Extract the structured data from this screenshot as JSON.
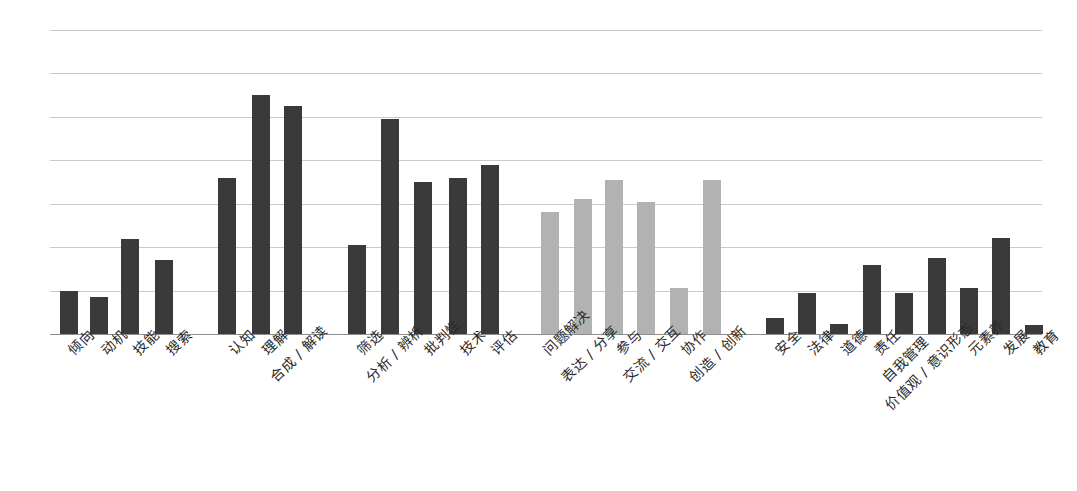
{
  "chart_data": {
    "type": "bar",
    "title": "",
    "subtitle": "",
    "xlabel": "",
    "ylabel": "",
    "ylim": [
      0,
      7
    ],
    "grid": true,
    "gridline_count": 8,
    "legend_position": "none",
    "orientation": "vertical",
    "label_rotation": -45,
    "colors": {
      "dark_bar": "#3a3a3a",
      "light_bar": "#b2b2b2",
      "gridline": "#c9c9c9",
      "axis": "#8d8d8d",
      "background": "#ffffff",
      "label_text": "#2a2a2a"
    },
    "groups": [
      {
        "name": "group-1",
        "color": "#3a3a3a",
        "categories": [
          "倾向",
          "动机",
          "技能",
          "搜索"
        ],
        "values": [
          1.0,
          0.86,
          2.18,
          1.7
        ]
      },
      {
        "name": "group-2",
        "color": "#3a3a3a",
        "categories": [
          "认知",
          "理解",
          "合成 / 解读",
          "筛选",
          "分析 / 辨析",
          "批判性",
          "技术",
          "评估"
        ],
        "values": [
          3.6,
          5.5,
          5.25,
          2.05,
          4.95,
          3.5,
          3.6,
          3.9
        ]
      },
      {
        "name": "group-3",
        "color": "#b2b2b2",
        "categories": [
          "问题解决",
          "表达 / 分享",
          "参与",
          "交流 / 交互",
          "协作",
          "创造 / 创新"
        ],
        "values": [
          2.8,
          3.12,
          3.55,
          3.05,
          1.05,
          3.55
        ]
      },
      {
        "name": "group-4",
        "color": "#3a3a3a",
        "categories": [
          "安全",
          "法律",
          "道德",
          "责任",
          "自我管理",
          "价值观 / 意识形态",
          "元素养",
          "发展",
          "教育"
        ],
        "values": [
          0.36,
          0.95,
          0.24,
          1.6,
          0.95,
          1.75,
          1.05,
          2.2,
          0.2
        ]
      }
    ],
    "categories_all": [
      "倾向",
      "动机",
      "技能",
      "搜索",
      "认知",
      "理解",
      "合成 / 解读",
      "筛选",
      "分析 / 辨析",
      "批判性",
      "技术",
      "评估",
      "问题解决",
      "表达 / 分享",
      "参与",
      "交流 / 交互",
      "协作",
      "创造 / 创新",
      "安全",
      "法律",
      "道德",
      "责任",
      "自我管理",
      "价值观 / 意识形态",
      "元素养",
      "发展",
      "教育"
    ],
    "values_all": [
      1.0,
      0.86,
      2.18,
      1.7,
      3.6,
      5.5,
      5.25,
      2.05,
      4.95,
      3.5,
      3.6,
      3.9,
      2.8,
      3.12,
      3.55,
      3.05,
      1.05,
      3.55,
      0.36,
      0.95,
      0.24,
      1.6,
      0.95,
      1.75,
      1.05,
      2.2,
      0.2
    ],
    "bars": [
      {
        "label": "倾向",
        "value": 1.0,
        "shade": "dark",
        "x": 60,
        "w": 18,
        "label_x": 63,
        "label_y": 345,
        "lines": 1
      },
      {
        "label": "动机",
        "value": 0.86,
        "shade": "dark",
        "x": 90,
        "w": 18,
        "label_x": 96,
        "label_y": 345,
        "lines": 1
      },
      {
        "label": "技能",
        "value": 2.18,
        "shade": "dark",
        "x": 121,
        "w": 18,
        "label_x": 128,
        "label_y": 345,
        "lines": 1
      },
      {
        "label": "搜索",
        "value": 1.7,
        "shade": "dark",
        "x": 155,
        "w": 18,
        "label_x": 161,
        "label_y": 345,
        "lines": 1
      },
      {
        "label": "认知",
        "value": 3.6,
        "shade": "dark",
        "x": 218,
        "w": 18,
        "label_x": 224,
        "label_y": 345,
        "lines": 1
      },
      {
        "label": "理解",
        "value": 5.5,
        "shade": "dark",
        "x": 252,
        "w": 18,
        "label_x": 257,
        "label_y": 345,
        "lines": 1
      },
      {
        "label": "合成 / 解读",
        "value": 5.25,
        "shade": "dark",
        "x": 284,
        "w": 18,
        "label_x": 265,
        "label_y": 372,
        "lines": 2
      },
      {
        "label": "筛选",
        "value": 2.05,
        "shade": "dark",
        "x": 348,
        "w": 18,
        "label_x": 352,
        "label_y": 345,
        "lines": 1
      },
      {
        "label": "分析 / 辨析",
        "value": 4.95,
        "shade": "dark",
        "x": 381,
        "w": 18,
        "label_x": 361,
        "label_y": 372,
        "lines": 2
      },
      {
        "label": "批判性",
        "value": 3.5,
        "shade": "dark",
        "x": 414,
        "w": 18,
        "label_x": 419,
        "label_y": 345,
        "lines": 1
      },
      {
        "label": "技术",
        "value": 3.6,
        "shade": "dark",
        "x": 449,
        "w": 18,
        "label_x": 455,
        "label_y": 345,
        "lines": 1
      },
      {
        "label": "评估",
        "value": 3.9,
        "shade": "dark",
        "x": 481,
        "w": 18,
        "label_x": 486,
        "label_y": 345,
        "lines": 1
      },
      {
        "label": "问题解决",
        "value": 2.8,
        "shade": "light",
        "x": 541,
        "w": 18,
        "label_x": 538,
        "label_y": 345,
        "lines": 1
      },
      {
        "label": "表达 / 分享",
        "value": 3.12,
        "shade": "light",
        "x": 574,
        "w": 18,
        "label_x": 556,
        "label_y": 372,
        "lines": 2
      },
      {
        "label": "参与",
        "value": 3.55,
        "shade": "light",
        "x": 605,
        "w": 18,
        "label_x": 611,
        "label_y": 345,
        "lines": 1
      },
      {
        "label": "交流 / 交互",
        "value": 3.05,
        "shade": "light",
        "x": 637,
        "w": 18,
        "label_x": 618,
        "label_y": 372,
        "lines": 2
      },
      {
        "label": "协作",
        "value": 1.05,
        "shade": "light",
        "x": 670,
        "w": 18,
        "label_x": 676,
        "label_y": 345,
        "lines": 1
      },
      {
        "label": "创造 / 创新",
        "value": 3.55,
        "shade": "light",
        "x": 703,
        "w": 18,
        "label_x": 684,
        "label_y": 372,
        "lines": 2
      },
      {
        "label": "安全",
        "value": 0.36,
        "shade": "dark",
        "x": 766,
        "w": 18,
        "label_x": 770,
        "label_y": 345,
        "lines": 1
      },
      {
        "label": "法律",
        "value": 0.95,
        "shade": "dark",
        "x": 798,
        "w": 18,
        "label_x": 803,
        "label_y": 345,
        "lines": 1
      },
      {
        "label": "道德",
        "value": 0.24,
        "shade": "dark",
        "x": 830,
        "w": 18,
        "label_x": 836,
        "label_y": 345,
        "lines": 1
      },
      {
        "label": "责任",
        "value": 1.6,
        "shade": "dark",
        "x": 863,
        "w": 18,
        "label_x": 869,
        "label_y": 345,
        "lines": 1
      },
      {
        "label": "自我管理",
        "value": 0.95,
        "shade": "dark",
        "x": 895,
        "w": 18,
        "label_x": 877,
        "label_y": 372,
        "lines": 2
      },
      {
        "label": "价值观 / 意识形态",
        "value": 1.75,
        "shade": "dark",
        "x": 928,
        "w": 18,
        "label_x": 880,
        "label_y": 400,
        "lines": 3
      },
      {
        "label": "元素养",
        "value": 1.05,
        "shade": "dark",
        "x": 960,
        "w": 18,
        "label_x": 963,
        "label_y": 345,
        "lines": 1
      },
      {
        "label": "发展",
        "value": 2.2,
        "shade": "dark",
        "x": 992,
        "w": 18,
        "label_x": 998,
        "label_y": 345,
        "lines": 1
      },
      {
        "label": "教育",
        "value": 0.2,
        "shade": "dark",
        "x": 1025,
        "w": 18,
        "label_x": 1028,
        "label_y": 345,
        "lines": 1
      }
    ]
  }
}
